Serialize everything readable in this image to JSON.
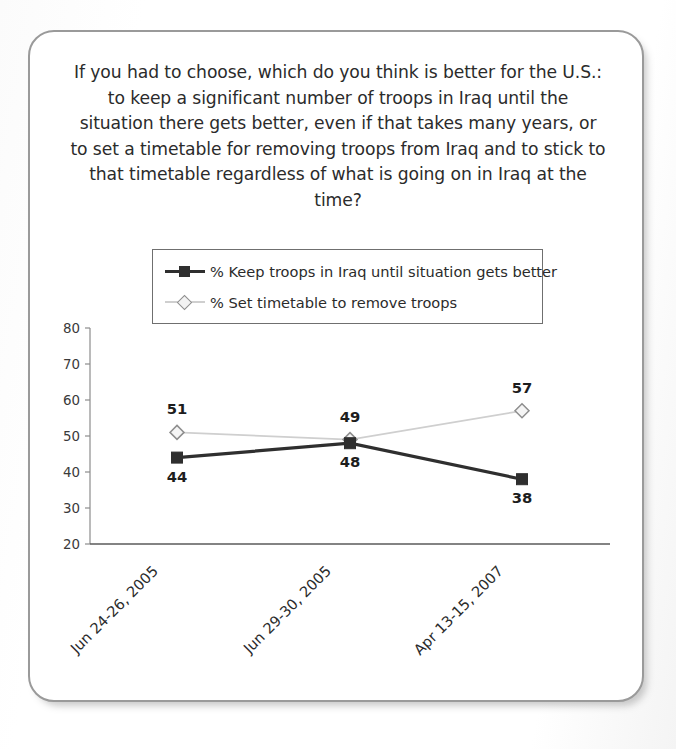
{
  "title": "If you had to choose, which do you think is better for the U.S.: to keep a significant number of troops in Iraq until the situation there gets better, even if that takes many years, or to set a timetable for removing troops from Iraq and to stick to that timetable regardless of what is going on in Iraq at the time?",
  "colors": {
    "keep_troops": "#2f2f2f",
    "set_timetable": "#cfcfcf",
    "card_border": "#9a9a9a",
    "axis": "#8c8c8c",
    "text": "#2b2b2b"
  },
  "chart_data": {
    "type": "line",
    "title": "If you had to choose, which do you think is better for the U.S.: to keep a significant number of troops in Iraq until the situation there gets better, even if that takes many years, or to set a timetable for removing troops from Iraq and to stick to that timetable regardless of what is going on in Iraq at the time?",
    "xlabel": "",
    "ylabel": "",
    "categories": [
      "Jun 24-26, 2005",
      "Jun 29-30, 2005",
      "Apr 13-15, 2007"
    ],
    "series": [
      {
        "name": "% Keep troops in Iraq until situation gets better",
        "values": [
          44,
          48,
          38
        ],
        "marker": "square",
        "color": "#2f2f2f",
        "label_position": "below"
      },
      {
        "name": "% Set timetable to remove troops",
        "values": [
          51,
          49,
          57
        ],
        "marker": "diamond",
        "color": "#cfcfcf",
        "label_position": "above"
      }
    ],
    "ylim": [
      20,
      80
    ],
    "yticks": [
      20,
      30,
      40,
      50,
      60,
      70,
      80
    ],
    "grid": false,
    "legend_position": "top-center",
    "xtick_rotation": 45
  }
}
